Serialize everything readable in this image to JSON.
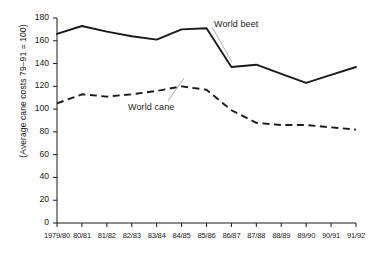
{
  "chart_data": {
    "type": "line",
    "title": "",
    "xlabel": "",
    "ylabel": "(Average cane costs 79–91 = 100)",
    "categories": [
      "1979/80",
      "80/81",
      "81/82",
      "82/83",
      "83/84",
      "84/85",
      "85/86",
      "86/87",
      "87/88",
      "88/89",
      "89/90",
      "90/91",
      "91/92"
    ],
    "ylim": [
      0,
      180
    ],
    "yticks": [
      0,
      20,
      40,
      60,
      80,
      100,
      120,
      140,
      160,
      180
    ],
    "grid": false,
    "legend": "inline-annotations",
    "series": [
      {
        "name": "World beet",
        "style": "solid",
        "color": "#1a1a1a",
        "values": [
          166,
          173,
          168,
          164,
          161,
          170,
          171,
          137,
          139,
          131,
          123,
          130,
          137
        ]
      },
      {
        "name": "World cane",
        "style": "dashed",
        "color": "#1a1a1a",
        "values": [
          105,
          113,
          111,
          113,
          116,
          120,
          117,
          99,
          88,
          86,
          86,
          84,
          82
        ]
      }
    ],
    "annotations": [
      {
        "text": "World beet",
        "target_series": "World beet"
      },
      {
        "text": "World cane",
        "target_series": "World cane"
      }
    ]
  },
  "ytick_labels": [
    "180",
    "160",
    "140",
    "120",
    "100",
    "80",
    "60",
    "40",
    "20",
    "0"
  ],
  "axis": {
    "y_title": "(Average cane costs 79–91 = 100)"
  }
}
